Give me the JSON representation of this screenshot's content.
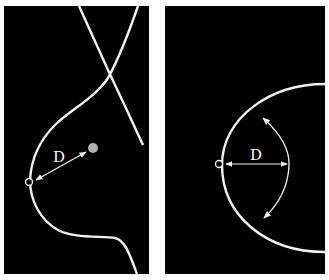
{
  "figure": {
    "panels": [
      {
        "id": "left",
        "view": "lateral",
        "distance_label": "D",
        "elements": [
          "chest-wall-line",
          "breast-contour",
          "nipple-marker",
          "lesion-dot",
          "distance-arrow"
        ]
      },
      {
        "id": "right",
        "view": "frontal",
        "distance_label": "D",
        "elements": [
          "breast-contour",
          "nipple-marker",
          "distance-arrow",
          "rotation-arc-arrow"
        ]
      }
    ],
    "colors": {
      "background": "#000000",
      "lines": "#f2f2f2",
      "lesion": "#b0b0b0",
      "page": "#ffffff"
    }
  }
}
